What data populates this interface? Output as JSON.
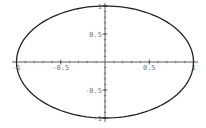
{
  "chart_data": {
    "type": "line",
    "title": "",
    "xlabel": "",
    "ylabel": "",
    "x_range": [
      -1,
      1
    ],
    "y_range": [
      -1,
      1
    ],
    "xlim": [
      -1.05,
      1.05
    ],
    "ylim": [
      -1.05,
      1.05
    ],
    "grid": false,
    "legend": null,
    "x_ticks": [
      -1,
      -0.5,
      0.5,
      1
    ],
    "y_ticks": [
      -1,
      -0.5,
      0.5,
      1
    ],
    "x_tick_labels": [
      "-1",
      "-0.5",
      "0.5",
      "1"
    ],
    "y_tick_labels": [
      "-1",
      "-0.5",
      "0.5",
      "1"
    ],
    "series": [
      {
        "name": "ellipse",
        "color": "#222222",
        "x": [
          1,
          0.866,
          0.5,
          0,
          -0.5,
          -0.866,
          -1,
          -0.866,
          -0.5,
          0,
          0.5,
          0.866,
          1
        ],
        "y": [
          0,
          0.5,
          0.866,
          1,
          0.866,
          0.5,
          0,
          -0.5,
          -0.866,
          -1,
          -0.866,
          -0.5,
          0
        ]
      }
    ]
  },
  "colors": {
    "curve": "#222222",
    "axis": "#333333",
    "tick_label": "#777777",
    "background": "#ffffff"
  }
}
